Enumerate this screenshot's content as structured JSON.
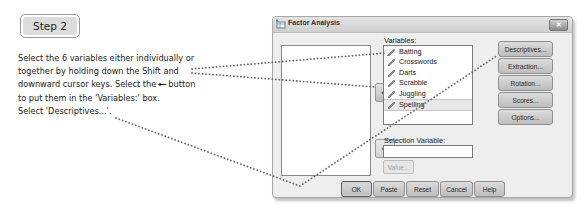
{
  "step": {
    "label": "Step 2"
  },
  "instructions": {
    "lines": [
      "Select the 6 variables either individually or",
      "together by holding down the Shift and",
      "downward cursor keys. Select the",
      "button",
      "to put them in the 'Variables:' box.",
      "Select 'Descriptives...'."
    ],
    "enter_glyph": "←"
  },
  "dialog": {
    "title": "Factor Analysis",
    "close_label": "✕",
    "variables_label": "Variables:",
    "variables": [
      {
        "name": "Batting",
        "selected": false
      },
      {
        "name": "Crosswords",
        "selected": false
      },
      {
        "name": "Darts",
        "selected": false
      },
      {
        "name": "Scrabble",
        "selected": false
      },
      {
        "name": "Juggling",
        "selected": false
      },
      {
        "name": "Spelling",
        "selected": true
      }
    ],
    "selection_variable_label": "Selection Variable:",
    "selection_variable_value": "",
    "value_button": "Value...",
    "move_arrow_glyph": "↵",
    "side_buttons": [
      {
        "label": "Descriptives...",
        "mnemonic": "D"
      },
      {
        "label": "Extraction...",
        "mnemonic": "E"
      },
      {
        "label": "Rotation...",
        "mnemonic": "T"
      },
      {
        "label": "Scores...",
        "mnemonic": "S"
      },
      {
        "label": "Options...",
        "mnemonic": "O"
      }
    ],
    "bottom_buttons": [
      {
        "label": "OK"
      },
      {
        "label": "Paste"
      },
      {
        "label": "Reset"
      },
      {
        "label": "Cancel"
      },
      {
        "label": "Help"
      }
    ]
  },
  "colors": {
    "callout_dots": "#666666",
    "dialog_bg": "#eeeeee",
    "button_face": "#cfcfcf"
  }
}
